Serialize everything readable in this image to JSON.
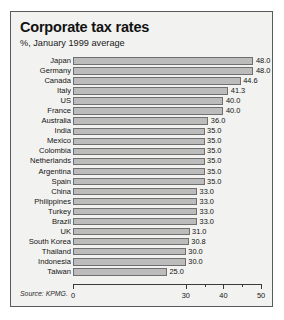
{
  "figure": {
    "title": "Corporate tax rates",
    "subtitle": "%, January 1999 average",
    "source": "Source: KPMG."
  },
  "colors": {
    "bar_fill": "#bcbcbc",
    "bar_border": "#6f6f6f",
    "frame": "#5a5a5a",
    "background": "#f2f2f0",
    "text": "#141414"
  },
  "chart_data": {
    "type": "bar",
    "orientation": "horizontal",
    "title": "Corporate tax rates",
    "subtitle": "%, January 1999 average",
    "xlabel": "",
    "ylabel": "",
    "xlim": [
      0,
      50
    ],
    "grid": false,
    "legend": "none",
    "source": "Source: KPMG.",
    "xticks": [
      0,
      30,
      40,
      50
    ],
    "xtick_labels": [
      "0",
      "30",
      "40",
      "50"
    ],
    "xminor_ticks": [
      35,
      45
    ],
    "categories": [
      "Japan",
      "Germany",
      "Canada",
      "Italy",
      "US",
      "France",
      "Australia",
      "India",
      "Mexico",
      "Colombia",
      "Netherlands",
      "Argentina",
      "Spain",
      "China",
      "Philippines",
      "Turkey",
      "Brazil",
      "UK",
      "South Korea",
      "Thailand",
      "Indonesia",
      "Taiwan"
    ],
    "values": [
      48.0,
      48.0,
      44.6,
      41.3,
      40.0,
      40.0,
      36.0,
      35.0,
      35.0,
      35.0,
      35.0,
      35.0,
      35.0,
      33.0,
      33.0,
      33.0,
      33.0,
      31.0,
      30.8,
      30.0,
      30.0,
      25.0
    ],
    "value_labels": [
      "48.0",
      "48.0",
      "44.6",
      "41.3",
      "40.0",
      "40.0",
      "36.0",
      "35.0",
      "35.0",
      "35.0",
      "35.0",
      "35.0",
      "35.0",
      "33.0",
      "33.0",
      "33.0",
      "33.0",
      "31.0",
      "30.8",
      "30.0",
      "30.0",
      "25.0"
    ]
  }
}
